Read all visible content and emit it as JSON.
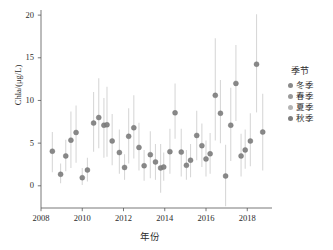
{
  "chart_data": {
    "type": "scatter",
    "title": "",
    "xlabel": "年份",
    "ylabel": "Chla/(μg/L)",
    "xlim": [
      2008,
      2019.2
    ],
    "ylim": [
      -2.6,
      20.6
    ],
    "xticks": [
      2008,
      2010,
      2012,
      2014,
      2016,
      2018
    ],
    "yticks": [
      0,
      5,
      10,
      15,
      20
    ],
    "grid": false,
    "errorbars": true,
    "legend": {
      "title": "季节",
      "position": "right",
      "entries": [
        {
          "name": "冬季",
          "color": "#8a8a8a"
        },
        {
          "name": "春季",
          "color": "#9a9a9a"
        },
        {
          "name": "夏季",
          "color": "#b4b4b4"
        },
        {
          "name": "秋季",
          "color": "#7e7e7e"
        }
      ]
    },
    "marker_color": "#7f7f7f",
    "errorbar_color": "#d8d8d8",
    "points": [
      {
        "x": 2008.55,
        "y": 4.05,
        "lo": 1.6,
        "hi": 6.3,
        "season": "冬季"
      },
      {
        "x": 2008.95,
        "y": 1.35,
        "lo": 0.3,
        "hi": 2.6,
        "season": "春季"
      },
      {
        "x": 2009.2,
        "y": 3.5,
        "lo": 1.7,
        "hi": 5.4,
        "season": "夏季"
      },
      {
        "x": 2009.45,
        "y": 5.35,
        "lo": 2.1,
        "hi": 8.7,
        "season": "秋季"
      },
      {
        "x": 2009.7,
        "y": 6.25,
        "lo": 2.7,
        "hi": 9.4,
        "season": "冬季"
      },
      {
        "x": 2010.0,
        "y": 0.95,
        "lo": 0.1,
        "hi": 2.1,
        "season": "春季"
      },
      {
        "x": 2010.25,
        "y": 1.85,
        "lo": 0.5,
        "hi": 3.3,
        "season": "夏季"
      },
      {
        "x": 2010.55,
        "y": 7.35,
        "lo": 4.0,
        "hi": 11.0,
        "season": "秋季"
      },
      {
        "x": 2010.8,
        "y": 8.0,
        "lo": 4.4,
        "hi": 12.6,
        "season": "冬季"
      },
      {
        "x": 2011.05,
        "y": 7.1,
        "lo": 3.3,
        "hi": 10.3,
        "season": "春季"
      },
      {
        "x": 2011.2,
        "y": 7.15,
        "lo": 3.4,
        "hi": 11.6,
        "season": "夏季"
      },
      {
        "x": 2011.45,
        "y": 5.25,
        "lo": 2.4,
        "hi": 8.4,
        "season": "秋季"
      },
      {
        "x": 2011.8,
        "y": 3.9,
        "lo": 1.4,
        "hi": 6.6,
        "season": "冬季"
      },
      {
        "x": 2012.05,
        "y": 2.15,
        "lo": 0.7,
        "hi": 3.7,
        "season": "春季"
      },
      {
        "x": 2012.25,
        "y": 5.8,
        "lo": 2.6,
        "hi": 9.1,
        "season": "夏季"
      },
      {
        "x": 2012.5,
        "y": 6.8,
        "lo": 3.2,
        "hi": 10.6,
        "season": "秋季"
      },
      {
        "x": 2012.75,
        "y": 4.5,
        "lo": 1.8,
        "hi": 7.4,
        "season": "冬季"
      },
      {
        "x": 2013.0,
        "y": 2.35,
        "lo": 0.6,
        "hi": 4.2,
        "season": "春季"
      },
      {
        "x": 2013.3,
        "y": 3.65,
        "lo": 0.9,
        "hi": 6.4,
        "season": "夏季"
      },
      {
        "x": 2013.55,
        "y": 2.8,
        "lo": 0.7,
        "hi": 4.9,
        "season": "秋季"
      },
      {
        "x": 2013.8,
        "y": 2.1,
        "lo": -0.8,
        "hi": 4.9,
        "season": "冬季"
      },
      {
        "x": 2013.95,
        "y": 2.2,
        "lo": 0.6,
        "hi": 3.9,
        "season": "春季"
      },
      {
        "x": 2014.25,
        "y": 4.0,
        "lo": 1.4,
        "hi": 6.7,
        "season": "夏季"
      },
      {
        "x": 2014.5,
        "y": 8.55,
        "lo": 5.5,
        "hi": 12.0,
        "season": "秋季"
      },
      {
        "x": 2014.8,
        "y": 3.95,
        "lo": 1.1,
        "hi": 6.7,
        "season": "冬季"
      },
      {
        "x": 2015.05,
        "y": 2.4,
        "lo": 0.7,
        "hi": 4.2,
        "season": "春季"
      },
      {
        "x": 2015.25,
        "y": 3.0,
        "lo": 1.0,
        "hi": 4.9,
        "season": "夏季"
      },
      {
        "x": 2015.55,
        "y": 5.9,
        "lo": 3.0,
        "hi": 8.8,
        "season": "秋季"
      },
      {
        "x": 2015.8,
        "y": 4.7,
        "lo": 2.2,
        "hi": 7.3,
        "season": "冬季"
      },
      {
        "x": 2016.0,
        "y": 3.15,
        "lo": 1.1,
        "hi": 5.3,
        "season": "春季"
      },
      {
        "x": 2016.2,
        "y": 3.75,
        "lo": 1.4,
        "hi": 6.2,
        "season": "夏季"
      },
      {
        "x": 2016.45,
        "y": 10.6,
        "lo": 5.3,
        "hi": 17.3,
        "season": "秋季"
      },
      {
        "x": 2016.7,
        "y": 8.5,
        "lo": 5.0,
        "hi": 12.4,
        "season": "冬季"
      },
      {
        "x": 2016.95,
        "y": 1.15,
        "lo": -2.4,
        "hi": 4.8,
        "season": "春季"
      },
      {
        "x": 2017.2,
        "y": 7.1,
        "lo": 2.9,
        "hi": 11.5,
        "season": "夏季"
      },
      {
        "x": 2017.45,
        "y": 12.0,
        "lo": 7.6,
        "hi": 16.5,
        "season": "秋季"
      },
      {
        "x": 2017.7,
        "y": 3.5,
        "lo": 1.1,
        "hi": 6.1,
        "season": "冬季"
      },
      {
        "x": 2017.9,
        "y": 4.2,
        "lo": 2.0,
        "hi": 6.6,
        "season": "春季"
      },
      {
        "x": 2018.15,
        "y": 5.25,
        "lo": 2.3,
        "hi": 8.5,
        "season": "夏季"
      },
      {
        "x": 2018.45,
        "y": 14.25,
        "lo": 8.6,
        "hi": 20.1,
        "season": "秋季"
      },
      {
        "x": 2018.75,
        "y": 6.3,
        "lo": 1.8,
        "hi": 10.8,
        "season": "冬季"
      }
    ]
  },
  "axes": {
    "yticklabels": [
      "0",
      "5",
      "10",
      "15",
      "20"
    ],
    "xticklabels": [
      "2008",
      "2010",
      "2012",
      "2014",
      "2016",
      "2018"
    ]
  }
}
